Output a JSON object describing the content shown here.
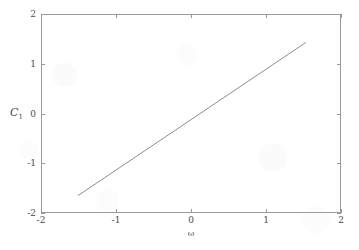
{
  "chart_data": {
    "type": "line",
    "title": "",
    "subtitle": "",
    "xlabel": "ω",
    "ylabel": "C₁",
    "ylabel_base": "C",
    "ylabel_sub": "1",
    "xlim": [
      -2,
      2
    ],
    "ylim": [
      -2,
      2
    ],
    "xticks": [
      -2,
      -1,
      0,
      1,
      2
    ],
    "yticks": [
      -2,
      -1,
      0,
      1,
      2
    ],
    "xtick_labels": [
      "-2",
      "-1",
      "0",
      "1",
      "2"
    ],
    "ytick_labels": [
      "-2",
      "-1",
      "0",
      "1",
      "2"
    ],
    "grid": false,
    "legend": null,
    "legend_position": "none",
    "box": true,
    "tick_direction": "in",
    "series": [
      {
        "name": "C1 vs omega",
        "style": "solid",
        "color": "#6e6e6e",
        "line_width": 0.8,
        "x": [
          -1.52,
          1.52
        ],
        "y": [
          -1.63,
          1.45
        ]
      }
    ],
    "annotations": [],
    "colors": {
      "line": "#6e6e6e",
      "axis": "#9a9a9a",
      "text": "#4a4a4a",
      "background": "#ffffff"
    }
  },
  "figure": {
    "width": 359,
    "height": 250,
    "plot_box": {
      "left": 41,
      "top": 14,
      "width": 300,
      "height": 199
    }
  }
}
